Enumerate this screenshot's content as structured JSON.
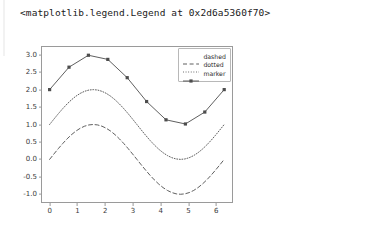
{
  "output": {
    "repr_text": "<matplotlib.legend.Legend at 0x2d6a5360f70>"
  },
  "figure": {
    "facecolor": "#ffffff",
    "axes_edge_color": "#9a9a9a",
    "tick_label_color": "#3a3a3a"
  },
  "legend": {
    "position": "upper right",
    "frame": true,
    "entries": [
      {
        "label": "dashed",
        "style": "dashed",
        "color": "#4d4d4d",
        "marker": "none"
      },
      {
        "label": "dotted",
        "style": "dotted",
        "color": "#4d4d4d",
        "marker": "none"
      },
      {
        "label": "marker",
        "style": "solid",
        "color": "#4d4d4d",
        "marker": "square"
      }
    ]
  },
  "chart_data": {
    "type": "line",
    "title": "",
    "xlabel": "",
    "ylabel": "",
    "xlim": [
      -0.31,
      6.6
    ],
    "ylim": [
      -1.25,
      3.25
    ],
    "grid": false,
    "legend_position": "upper right",
    "xticks": [
      0,
      1,
      2,
      3,
      4,
      5,
      6
    ],
    "xtick_labels": [
      "0",
      "1",
      "2",
      "3",
      "4",
      "5",
      "6"
    ],
    "yticks": [
      -1.0,
      -0.5,
      0.0,
      0.5,
      1.0,
      1.5,
      2.0,
      2.5,
      3.0
    ],
    "ytick_labels": [
      "-1.0",
      "-0.5",
      "0.0",
      "0.5",
      "1.0",
      "1.5",
      "2.0",
      "2.5",
      "3.0"
    ],
    "series": [
      {
        "name": "dashed",
        "style": "dashed",
        "color": "#4d4d4d",
        "marker": "none",
        "x": [
          0.0,
          0.1571,
          0.3142,
          0.4712,
          0.6283,
          0.7854,
          0.9425,
          1.0996,
          1.2566,
          1.4137,
          1.5708,
          1.7279,
          1.885,
          2.042,
          2.1991,
          2.3562,
          2.5133,
          2.6704,
          2.8274,
          2.9845,
          3.1416,
          3.2987,
          3.4558,
          3.6128,
          3.7699,
          3.927,
          4.0841,
          4.2412,
          4.3982,
          4.5553,
          4.7124,
          4.8695,
          5.0265,
          5.1836,
          5.3407,
          5.4978,
          5.6549,
          5.8119,
          5.969,
          6.1261,
          6.2832
        ],
        "y": [
          0.0,
          0.1564,
          0.309,
          0.454,
          0.5878,
          0.7071,
          0.809,
          0.891,
          0.9511,
          0.9877,
          1.0,
          0.9877,
          0.9511,
          0.891,
          0.809,
          0.7071,
          0.5878,
          0.454,
          0.309,
          0.1564,
          0.0,
          -0.1564,
          -0.309,
          -0.454,
          -0.5878,
          -0.7071,
          -0.809,
          -0.891,
          -0.9511,
          -0.9877,
          -1.0,
          -0.9877,
          -0.9511,
          -0.891,
          -0.809,
          -0.7071,
          -0.5878,
          -0.454,
          -0.309,
          -0.1564,
          0.0
        ]
      },
      {
        "name": "dotted",
        "style": "dotted",
        "color": "#4d4d4d",
        "marker": "none",
        "x": [
          0.0,
          0.1571,
          0.3142,
          0.4712,
          0.6283,
          0.7854,
          0.9425,
          1.0996,
          1.2566,
          1.4137,
          1.5708,
          1.7279,
          1.885,
          2.042,
          2.1991,
          2.3562,
          2.5133,
          2.6704,
          2.8274,
          2.9845,
          3.1416,
          3.2987,
          3.4558,
          3.6128,
          3.7699,
          3.927,
          4.0841,
          4.2412,
          4.3982,
          4.5553,
          4.7124,
          4.8695,
          5.0265,
          5.1836,
          5.3407,
          5.4978,
          5.6549,
          5.8119,
          5.969,
          6.1261,
          6.2832
        ],
        "y": [
          1.0,
          1.1564,
          1.309,
          1.454,
          1.5878,
          1.7071,
          1.809,
          1.891,
          1.9511,
          1.9877,
          2.0,
          1.9877,
          1.9511,
          1.891,
          1.809,
          1.7071,
          1.5878,
          1.454,
          1.309,
          1.1564,
          1.0,
          0.8436,
          0.691,
          0.546,
          0.4122,
          0.2929,
          0.191,
          0.109,
          0.0489,
          0.0123,
          0.0,
          0.0123,
          0.0489,
          0.109,
          0.191,
          0.2929,
          0.4122,
          0.546,
          0.691,
          0.8436,
          1.0
        ]
      },
      {
        "name": "marker",
        "style": "solid",
        "color": "#4d4d4d",
        "marker": "square",
        "x": [
          0.0,
          0.6981,
          1.3963,
          2.0944,
          2.7925,
          3.4907,
          4.1888,
          4.8869,
          5.5851,
          6.2832
        ],
        "y": [
          2.0,
          2.6428,
          2.9848,
          2.866,
          2.342,
          1.658,
          1.134,
          1.0152,
          1.3572,
          2.0
        ]
      }
    ]
  }
}
